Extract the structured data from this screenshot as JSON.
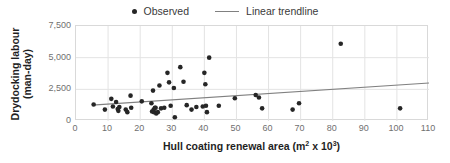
{
  "chart_data": {
    "type": "scatter",
    "title": "",
    "xlabel": "Hull coating renewal area (m² x 10³)",
    "xlabel_base": "Hull coating renewal area (m",
    "xlabel_sup1": "2",
    "xlabel_mid": " x 10",
    "xlabel_sup2": "3",
    "xlabel_end": ")",
    "ylabel_line1": "Drydocking labour",
    "ylabel_line2": "(man-day)",
    "xlim": [
      0,
      110
    ],
    "ylim": [
      0,
      7500
    ],
    "xticks": [
      0,
      10,
      20,
      30,
      40,
      50,
      60,
      70,
      80,
      90,
      100,
      110
    ],
    "xtick_labels": [
      "0",
      "10",
      "20",
      "30",
      "40",
      "50",
      "60",
      "70",
      "80",
      "90",
      "100",
      "110"
    ],
    "yticks": [
      0,
      2500,
      5000,
      7500
    ],
    "ytick_labels": [
      "0",
      "2,500",
      "5,000",
      "7,500"
    ],
    "grid": "both",
    "legend_position": "top-center",
    "legend": [
      {
        "label": "Observed",
        "marker": "dot",
        "color": "#262626"
      },
      {
        "label": "Linear trendline",
        "marker": "line",
        "color": "#808080"
      }
    ],
    "series": [
      {
        "name": "Observed",
        "marker": "dot",
        "color": "#262626",
        "points": [
          [
            5.5,
            1300
          ],
          [
            9.0,
            900
          ],
          [
            11.0,
            1750
          ],
          [
            11.5,
            1150
          ],
          [
            12.5,
            1500
          ],
          [
            13.0,
            950
          ],
          [
            13.2,
            800
          ],
          [
            13.5,
            1100
          ],
          [
            15.5,
            900
          ],
          [
            16.0,
            700
          ],
          [
            17.0,
            2000
          ],
          [
            17.2,
            1050
          ],
          [
            20.5,
            1550
          ],
          [
            23.5,
            1400
          ],
          [
            23.7,
            750
          ],
          [
            24.0,
            2400
          ],
          [
            24.2,
            900
          ],
          [
            24.3,
            700
          ],
          [
            24.6,
            1050
          ],
          [
            24.8,
            1050
          ],
          [
            25.0,
            600
          ],
          [
            25.5,
            700
          ],
          [
            26.0,
            2800
          ],
          [
            26.5,
            1000
          ],
          [
            27.5,
            1050
          ],
          [
            28.5,
            3800
          ],
          [
            29.0,
            3050
          ],
          [
            29.5,
            1200
          ],
          [
            30.5,
            2600
          ],
          [
            30.8,
            300
          ],
          [
            32.5,
            4250
          ],
          [
            33.5,
            3100
          ],
          [
            34.5,
            1250
          ],
          [
            36.0,
            900
          ],
          [
            37.5,
            1100
          ],
          [
            39.5,
            1150
          ],
          [
            40.0,
            3800
          ],
          [
            40.3,
            2900
          ],
          [
            40.5,
            1200
          ],
          [
            40.8,
            700
          ],
          [
            41.5,
            5000
          ],
          [
            44.5,
            1200
          ],
          [
            49.5,
            1800
          ],
          [
            56.0,
            2050
          ],
          [
            57.0,
            1850
          ],
          [
            58.0,
            1000
          ],
          [
            67.5,
            900
          ],
          [
            69.5,
            1400
          ],
          [
            82.5,
            6100
          ],
          [
            101.0,
            1000
          ]
        ]
      }
    ],
    "trendline": {
      "name": "Linear trendline",
      "color": "#808080",
      "x_start": 5.0,
      "y_start": 1250,
      "x_end": 110.0,
      "y_end": 3000
    }
  }
}
